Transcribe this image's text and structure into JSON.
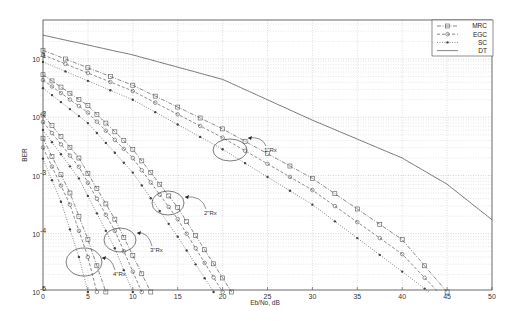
{
  "chart_data": {
    "type": "line",
    "title": "",
    "xlabel": "Eb/No, dB",
    "ylabel": "BER",
    "xlim": [
      0,
      50
    ],
    "ylim": [
      1e-05,
      0.47
    ],
    "yscale": "log",
    "grid": true,
    "legend_position": "upper right",
    "x_ticks": [
      "0",
      "5",
      "10",
      "15",
      "20",
      "25",
      "30",
      "35",
      "40",
      "45",
      "50"
    ],
    "y_ticks": [
      "10^-1",
      "10^-2",
      "10^-3",
      "10^-4",
      "10^-5"
    ],
    "legend": [
      {
        "label": "MRC",
        "style": "dash-dot",
        "marker": "square"
      },
      {
        "label": "EGC",
        "style": "dashed",
        "marker": "circle"
      },
      {
        "label": "SC",
        "style": "dotted",
        "marker": "star"
      },
      {
        "label": "DT",
        "style": "solid",
        "marker": "none"
      }
    ],
    "series": [
      {
        "name": "DT",
        "group": "1 Rx",
        "x": [
          0,
          10,
          20,
          25,
          30,
          40,
          45,
          50
        ],
        "log10_ber": [
          -0.59,
          -0.93,
          -1.35,
          -1.7,
          -2.05,
          -2.7,
          -3.15,
          -3.76
        ]
      },
      {
        "name": "MRC",
        "group": "1 Rx",
        "x": [
          0,
          10,
          20,
          30,
          40,
          45
        ],
        "log10_ber": [
          -0.85,
          -1.45,
          -2.2,
          -3.05,
          -4.1,
          -5.0
        ]
      },
      {
        "name": "EGC",
        "group": "1 Rx",
        "x": [
          0,
          10,
          20,
          30,
          40,
          44
        ],
        "log10_ber": [
          -0.93,
          -1.55,
          -2.35,
          -3.25,
          -4.35,
          -5.0
        ]
      },
      {
        "name": "SC",
        "group": "1 Rx",
        "x": [
          0,
          10,
          20,
          30,
          40,
          43
        ],
        "log10_ber": [
          -1.05,
          -1.7,
          -2.55,
          -3.5,
          -4.65,
          -5.0
        ]
      },
      {
        "name": "MRC",
        "group": "2 Rx",
        "x": [
          0,
          5,
          10,
          15,
          21
        ],
        "log10_ber": [
          -1.27,
          -1.8,
          -2.55,
          -3.55,
          -5.0
        ]
      },
      {
        "name": "EGC",
        "group": "2 Rx",
        "x": [
          0,
          5,
          10,
          15,
          20
        ],
        "log10_ber": [
          -1.36,
          -1.92,
          -2.7,
          -3.75,
          -5.0
        ]
      },
      {
        "name": "SC",
        "group": "2 Rx",
        "x": [
          0,
          5,
          10,
          15,
          19
        ],
        "log10_ber": [
          -1.5,
          -2.1,
          -2.95,
          -4.05,
          -5.0
        ]
      },
      {
        "name": "MRC",
        "group": "3 Rx",
        "x": [
          0,
          4,
          8,
          12
        ],
        "log10_ber": [
          -1.96,
          -2.7,
          -3.75,
          -5.0
        ]
      },
      {
        "name": "EGC",
        "group": "3 Rx",
        "x": [
          0,
          4,
          8,
          11
        ],
        "log10_ber": [
          -2.08,
          -2.85,
          -3.95,
          -5.0
        ]
      },
      {
        "name": "SC",
        "group": "3 Rx",
        "x": [
          0,
          4,
          8,
          10
        ],
        "log10_ber": [
          -2.22,
          -3.05,
          -4.25,
          -5.0
        ]
      },
      {
        "name": "MRC",
        "group": "4 Rx",
        "x": [
          0,
          3,
          5,
          7
        ],
        "log10_ber": [
          -2.36,
          -3.3,
          -4.1,
          -5.0
        ]
      },
      {
        "name": "EGC",
        "group": "4 Rx",
        "x": [
          0,
          3,
          5,
          6
        ],
        "log10_ber": [
          -2.52,
          -3.5,
          -4.4,
          -5.0
        ]
      },
      {
        "name": "SC",
        "group": "4 Rx",
        "x": [
          0,
          2,
          4,
          5
        ],
        "log10_ber": [
          -2.71,
          -3.45,
          -4.4,
          -5.0
        ]
      }
    ],
    "annotations": [
      {
        "text": "1\"Rx",
        "x_db": 25,
        "log10_ber": -2.6
      },
      {
        "text": "2\"Rx",
        "x_db": 18.5,
        "log10_ber": -3.65
      },
      {
        "text": "3\"Rx",
        "x_db": 12,
        "log10_ber": -4.25
      },
      {
        "text": "4\"Rx",
        "x_db": 8,
        "log10_ber": -4.65
      }
    ]
  },
  "labels": {
    "xlabel": "Eb/No, dB",
    "ylabel": "BER",
    "legend": [
      "MRC",
      "EGC",
      "SC",
      "DT"
    ],
    "annotations": [
      "1\"Rx",
      "2\"Rx",
      "3\"Rx",
      "4\"Rx"
    ],
    "x_ticks": [
      "0",
      "5",
      "10",
      "15",
      "20",
      "25",
      "30",
      "35",
      "40",
      "45",
      "50"
    ],
    "y_tick_base": "10",
    "y_tick_exp": [
      "-1",
      "-2",
      "-3",
      "-4",
      "-5"
    ]
  }
}
